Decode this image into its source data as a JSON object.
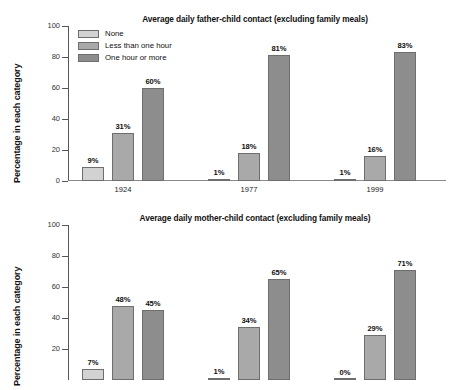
{
  "chart_data": [
    {
      "id": "father",
      "type": "bar",
      "title": "Average daily father-child contact (excluding family meals)",
      "xlabel": "",
      "ylabel": "Percentage in each category",
      "ylim": [
        0,
        100
      ],
      "yticks": [
        0,
        20,
        40,
        60,
        80,
        100
      ],
      "ytick_labels": [
        "0",
        "20",
        "40",
        "60",
        "80",
        "100"
      ],
      "grid": false,
      "legend_position": "top-left",
      "categories": [
        "1924",
        "1977",
        "1999"
      ],
      "series": [
        {
          "name": "None",
          "color": "#d2d2d2",
          "values": [
            9,
            1,
            1
          ],
          "labels": [
            "9%",
            "1%",
            "1%"
          ]
        },
        {
          "name": "Less than one hour",
          "color": "#a9a9a9",
          "values": [
            31,
            18,
            16
          ],
          "labels": [
            "31%",
            "18%",
            "16%"
          ]
        },
        {
          "name": "One hour or more",
          "color": "#8d8d8d",
          "values": [
            60,
            81,
            83
          ],
          "labels": [
            "60%",
            "81%",
            "83%"
          ]
        }
      ]
    },
    {
      "id": "mother",
      "type": "bar",
      "title": "Average daily mother-child contact (excluding family meals)",
      "xlabel": "",
      "ylabel": "Percentage in each category",
      "ylim": [
        0,
        100
      ],
      "yticks": [
        20,
        40,
        60,
        80,
        100
      ],
      "ytick_labels": [
        "20",
        "40",
        "60",
        "80",
        "100"
      ],
      "grid": false,
      "legend_position": "none",
      "categories": [
        "1924",
        "1977",
        "1999"
      ],
      "series": [
        {
          "name": "None",
          "color": "#d2d2d2",
          "values": [
            7,
            1,
            0
          ],
          "labels": [
            "7%",
            "1%",
            "0%"
          ]
        },
        {
          "name": "Less than one hour",
          "color": "#a9a9a9",
          "values": [
            48,
            34,
            29
          ],
          "labels": [
            "48%",
            "34%",
            "29%"
          ]
        },
        {
          "name": "One hour or more",
          "color": "#8d8d8d",
          "values": [
            45,
            65,
            71
          ],
          "labels": [
            "45%",
            "65%",
            "71%"
          ]
        }
      ]
    }
  ]
}
